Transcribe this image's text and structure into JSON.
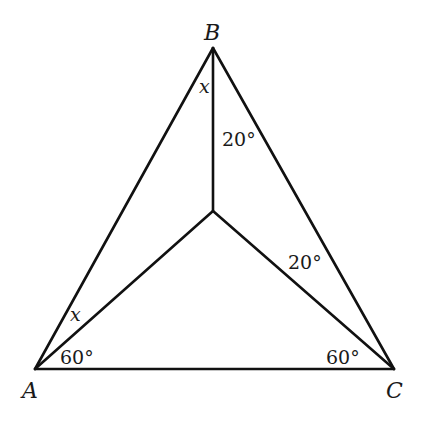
{
  "diagram": {
    "type": "geometry-triangle",
    "vertices": {
      "A": {
        "label": "A",
        "x": 35,
        "y": 369
      },
      "B": {
        "label": "B",
        "x": 213,
        "y": 48
      },
      "C": {
        "label": "C",
        "x": 394,
        "y": 369
      },
      "D": {
        "label": "",
        "x": 213,
        "y": 211
      }
    },
    "angle_labels": {
      "at_B_left": "x",
      "at_A_upper": "x",
      "at_B_right": "20°",
      "at_C_upper": "20°",
      "at_A_lower": "60°",
      "at_C_lower": "60°"
    },
    "colors": {
      "line": "#111111",
      "text": "#1a1a1a",
      "background": "#ffffff"
    }
  }
}
